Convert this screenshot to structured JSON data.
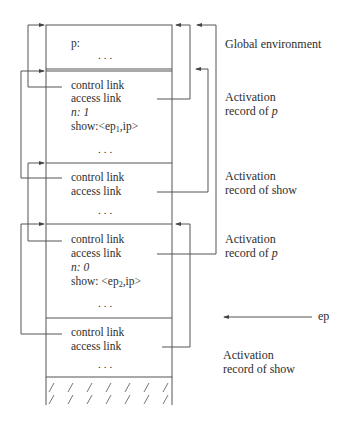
{
  "diagram": {
    "type": "runtime-stack-activation-records",
    "records": [
      {
        "id": "global",
        "fields": [
          "p:"
        ],
        "ellipsis": "...",
        "label": [
          "Global environment"
        ]
      },
      {
        "id": "p1",
        "fields": [
          "control link",
          "access link",
          "n: 1"
        ],
        "show_field": {
          "prefix": "show:<ep",
          "sub": "1",
          "suffix": ",ip>"
        },
        "ellipsis": "...",
        "label": [
          "Activation",
          "record of "
        ],
        "label_var": "p"
      },
      {
        "id": "show1",
        "fields": [
          "control link",
          "access link"
        ],
        "ellipsis": "...",
        "label": [
          "Activation",
          "record of show"
        ]
      },
      {
        "id": "p2",
        "fields": [
          "control link",
          "access link",
          "n: 0"
        ],
        "show_field": {
          "prefix": "show: <ep",
          "sub": "2",
          "suffix": ",ip>"
        },
        "ellipsis": "...",
        "label": [
          "Activation",
          "record of "
        ],
        "label_var": "p"
      },
      {
        "id": "show2",
        "fields": [
          "control link",
          "access link"
        ],
        "ellipsis": "...",
        "label": [
          "Activation",
          "record of show"
        ]
      }
    ],
    "pointer": {
      "label": "ep"
    },
    "colors": {
      "line": "#555555",
      "text": "#2e2e2e",
      "background": "#ffffff"
    }
  }
}
